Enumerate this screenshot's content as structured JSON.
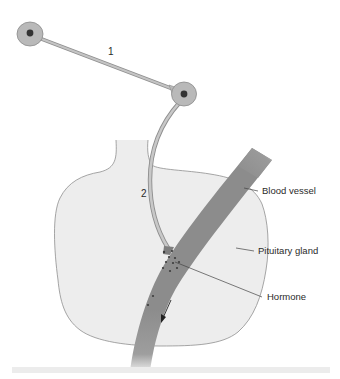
{
  "diagram": {
    "type": "neurosecretory-pathway",
    "neurons": [
      {
        "id": "neuron-1",
        "label": "1"
      },
      {
        "id": "neuron-2",
        "label": "2"
      }
    ],
    "labels": {
      "blood_vessel": "Blood vessel",
      "pituitary_gland": "Pituitary gland",
      "hormone": "Hormone"
    },
    "flow_direction_icon": "arrow-down-left-icon",
    "colors": {
      "cell_body": "#b9b9b9",
      "nucleus": "#333333",
      "axon": "#bdbdbd",
      "gland_fill": "#ededed",
      "gland_outline": "#8f8f8f",
      "blood_vessel": "#8c8c8c",
      "hormone_dots": "#3d3d3d",
      "leader_line": "#444444",
      "text": "#2a2a2a"
    }
  }
}
